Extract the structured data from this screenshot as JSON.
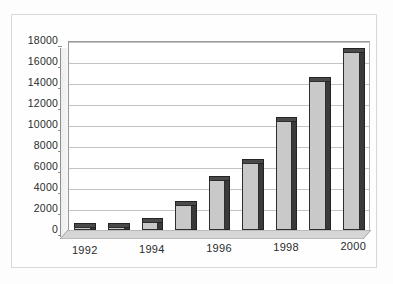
{
  "chart_data": {
    "type": "bar",
    "title": "",
    "subtitle": "",
    "xlabel": "",
    "ylabel": "",
    "categories": [
      "1992",
      "1993",
      "1994",
      "1995",
      "1996",
      "1997",
      "1998",
      "1999",
      "2000"
    ],
    "tick_labels_x": [
      "1992",
      "1994",
      "1996",
      "1998",
      "2000"
    ],
    "values": [
      180,
      320,
      800,
      2400,
      4800,
      6400,
      10400,
      14200,
      17000
    ],
    "ylim": [
      0,
      18000
    ],
    "ytick_step": 2000,
    "ytick_labels": [
      "18000",
      "16000",
      "14000",
      "12000",
      "10000",
      "8000",
      "6000",
      "4000",
      "2000",
      "0"
    ],
    "ytick_values": [
      18000,
      16000,
      14000,
      12000,
      10000,
      8000,
      6000,
      4000,
      2000,
      0
    ],
    "grid": true,
    "legend": false,
    "legend_position": "none",
    "style": "3d-column",
    "series": [
      {
        "name": "",
        "values": [
          180,
          320,
          800,
          2400,
          4800,
          6400,
          10400,
          14200,
          17000
        ]
      }
    ],
    "colors": {
      "bar_face": "#c9c9c9",
      "bar_side": "#3a3a3a",
      "bar_top": "#4a4a4a",
      "gridline": "#c4c4c4",
      "axis": "#9a9a9a",
      "text": "#2b2b2b",
      "plot_background": "#ffffff",
      "page_background": "#fdfdfd",
      "frame": "#d8d8d8"
    }
  }
}
